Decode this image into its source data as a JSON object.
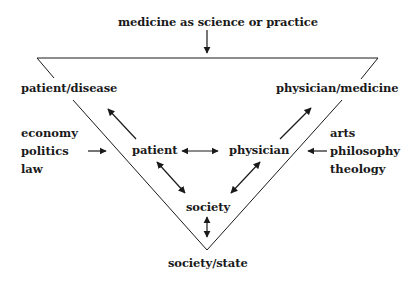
{
  "diagram": {
    "top_label": "medicine as science or practice",
    "corner_left": "patient/disease",
    "corner_right": "physician/medicine",
    "bottom_label": "society/state",
    "inner": {
      "patient": "patient",
      "physician": "physician",
      "society": "society"
    },
    "left_influences": [
      "economy",
      "politics",
      "law"
    ],
    "right_influences": [
      "arts",
      "philosophy",
      "theology"
    ]
  }
}
